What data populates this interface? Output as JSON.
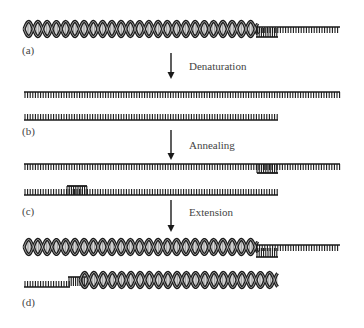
{
  "colors": {
    "ink": "#1a1a1a",
    "label": "#444444",
    "background": "#ffffff"
  },
  "panels": [
    {
      "id": "a",
      "label": "(a)",
      "content": "Double-stranded DNA template helix with single-stranded overhang on the right"
    },
    {
      "id": "b",
      "label": "(b)",
      "content": "Two separated single strands"
    },
    {
      "id": "c",
      "label": "(c)",
      "content": "Single strands each with a short annealed primer"
    },
    {
      "id": "d",
      "label": "(d)",
      "content": "Two new double-stranded helices after primer extension"
    }
  ],
  "steps": [
    {
      "from": "a",
      "to": "b",
      "label": "Denaturation"
    },
    {
      "from": "b",
      "to": "c",
      "label": "Annealing"
    },
    {
      "from": "c",
      "to": "d",
      "label": "Extension"
    }
  ]
}
